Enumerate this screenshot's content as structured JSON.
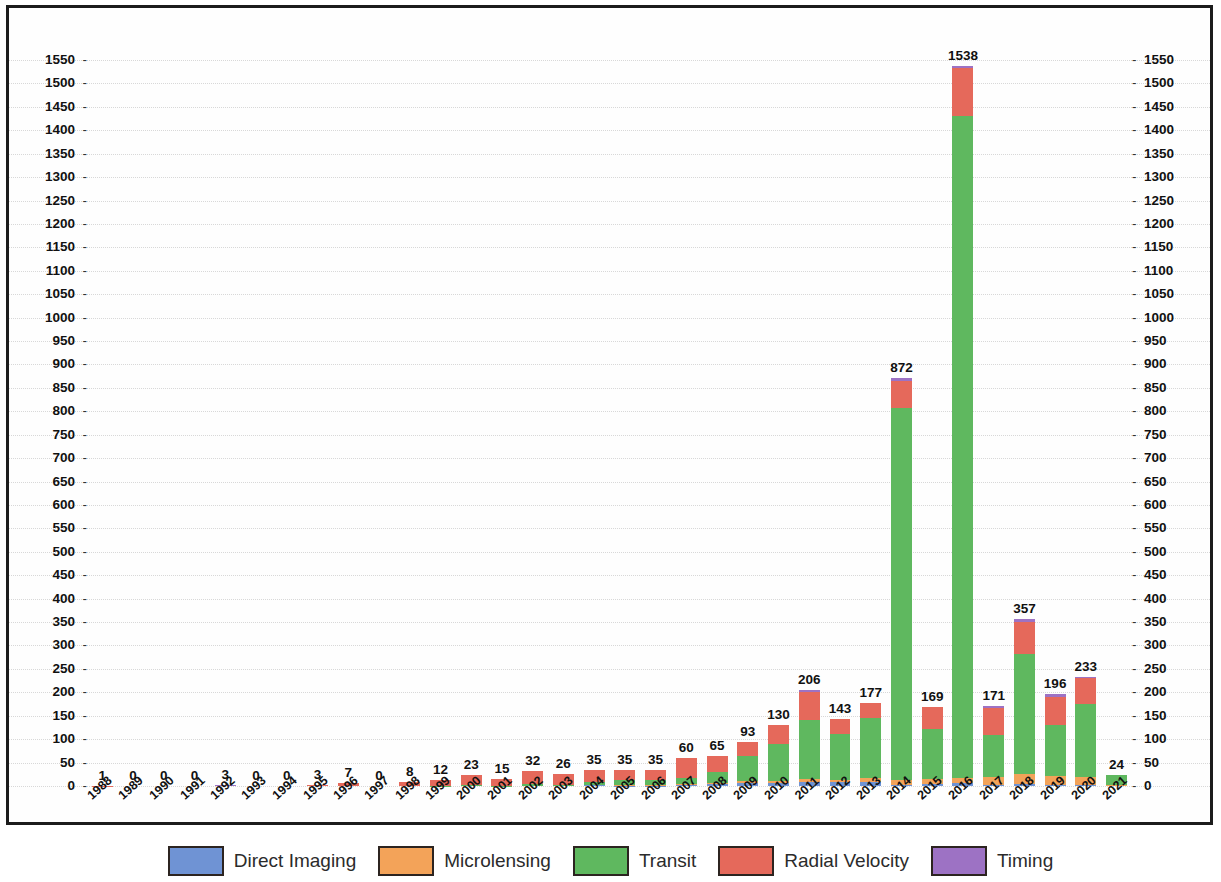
{
  "chart_data": {
    "type": "bar",
    "stacked": true,
    "title": "",
    "subtitle": "",
    "xlabel": "",
    "ylabel": "",
    "grid": true,
    "legend_position": "bottom",
    "ylim": [
      0,
      1580
    ],
    "ytick_step": 50,
    "yticks": [
      0,
      50,
      100,
      150,
      200,
      250,
      300,
      350,
      400,
      450,
      500,
      550,
      600,
      650,
      700,
      750,
      800,
      850,
      900,
      950,
      1000,
      1050,
      1100,
      1150,
      1200,
      1250,
      1300,
      1350,
      1400,
      1450,
      1500,
      1550
    ],
    "categories": [
      "1988",
      "1989",
      "1990",
      "1991",
      "1992",
      "1993",
      "1994",
      "1995",
      "1996",
      "1997",
      "1998",
      "1999",
      "2000",
      "2001",
      "2002",
      "2003",
      "2004",
      "2005",
      "2006",
      "2007",
      "2008",
      "2009",
      "2010",
      "2011",
      "2012",
      "2013",
      "2014",
      "2015",
      "2016",
      "2017",
      "2018",
      "2019",
      "2020",
      "2021"
    ],
    "totals": [
      1,
      0,
      0,
      0,
      3,
      0,
      0,
      3,
      7,
      0,
      8,
      12,
      23,
      15,
      32,
      26,
      35,
      35,
      35,
      60,
      65,
      93,
      130,
      206,
      143,
      177,
      872,
      169,
      1538,
      171,
      357,
      196,
      233,
      24
    ],
    "bar_labels": [
      "1",
      "0",
      "0",
      "0",
      "3",
      "0",
      "0",
      "3",
      "7",
      "0",
      "8",
      "12",
      "23",
      "15",
      "32",
      "26",
      "35",
      "35",
      "35",
      "60",
      "65",
      "93",
      "130",
      "206",
      "143",
      "177",
      "872",
      "169",
      "1538",
      "171",
      "357",
      "196",
      "233",
      "24"
    ],
    "series": [
      {
        "name": "Direct Imaging",
        "color": "#6f93d4",
        "values": [
          0,
          0,
          0,
          0,
          0,
          0,
          0,
          0,
          0,
          0,
          0,
          0,
          0,
          0,
          0,
          0,
          2,
          1,
          1,
          2,
          4,
          6,
          6,
          8,
          8,
          9,
          3,
          5,
          6,
          3,
          4,
          3,
          2,
          0
        ]
      },
      {
        "name": "Microlensing",
        "color": "#f3a359",
        "values": [
          0,
          0,
          0,
          0,
          0,
          0,
          0,
          0,
          0,
          0,
          0,
          0,
          0,
          0,
          0,
          0,
          1,
          2,
          2,
          3,
          2,
          4,
          5,
          7,
          5,
          8,
          9,
          9,
          12,
          16,
          22,
          18,
          18,
          2
        ]
      },
      {
        "name": "Transit",
        "color": "#5fb85f",
        "values": [
          0,
          0,
          0,
          0,
          0,
          0,
          0,
          0,
          0,
          0,
          0,
          1,
          2,
          1,
          4,
          3,
          6,
          9,
          10,
          13,
          23,
          54,
          79,
          126,
          99,
          129,
          795,
          108,
          1412,
          91,
          256,
          109,
          155,
          21
        ]
      },
      {
        "name": "Radial Velocity",
        "color": "#e5695b",
        "values": [
          1,
          0,
          0,
          0,
          0,
          0,
          0,
          3,
          7,
          0,
          8,
          11,
          21,
          14,
          28,
          23,
          26,
          23,
          22,
          42,
          36,
          29,
          40,
          60,
          31,
          31,
          57,
          47,
          104,
          57,
          68,
          60,
          56,
          1
        ]
      },
      {
        "name": "Timing",
        "color": "#9d72c4",
        "values": [
          0,
          0,
          0,
          0,
          3,
          0,
          0,
          0,
          0,
          0,
          0,
          0,
          0,
          0,
          0,
          0,
          0,
          0,
          0,
          0,
          0,
          0,
          0,
          5,
          0,
          0,
          8,
          0,
          4,
          4,
          7,
          6,
          2,
          0
        ]
      }
    ]
  },
  "legend": {
    "items": [
      {
        "label": "Direct Imaging",
        "color": "#6f93d4"
      },
      {
        "label": "Microlensing",
        "color": "#f3a359"
      },
      {
        "label": "Transit",
        "color": "#5fb85f"
      },
      {
        "label": "Radial Velocity",
        "color": "#e5695b"
      },
      {
        "label": "Timing",
        "color": "#9d72c4"
      }
    ]
  },
  "axes": {
    "tick_dash": "-"
  }
}
